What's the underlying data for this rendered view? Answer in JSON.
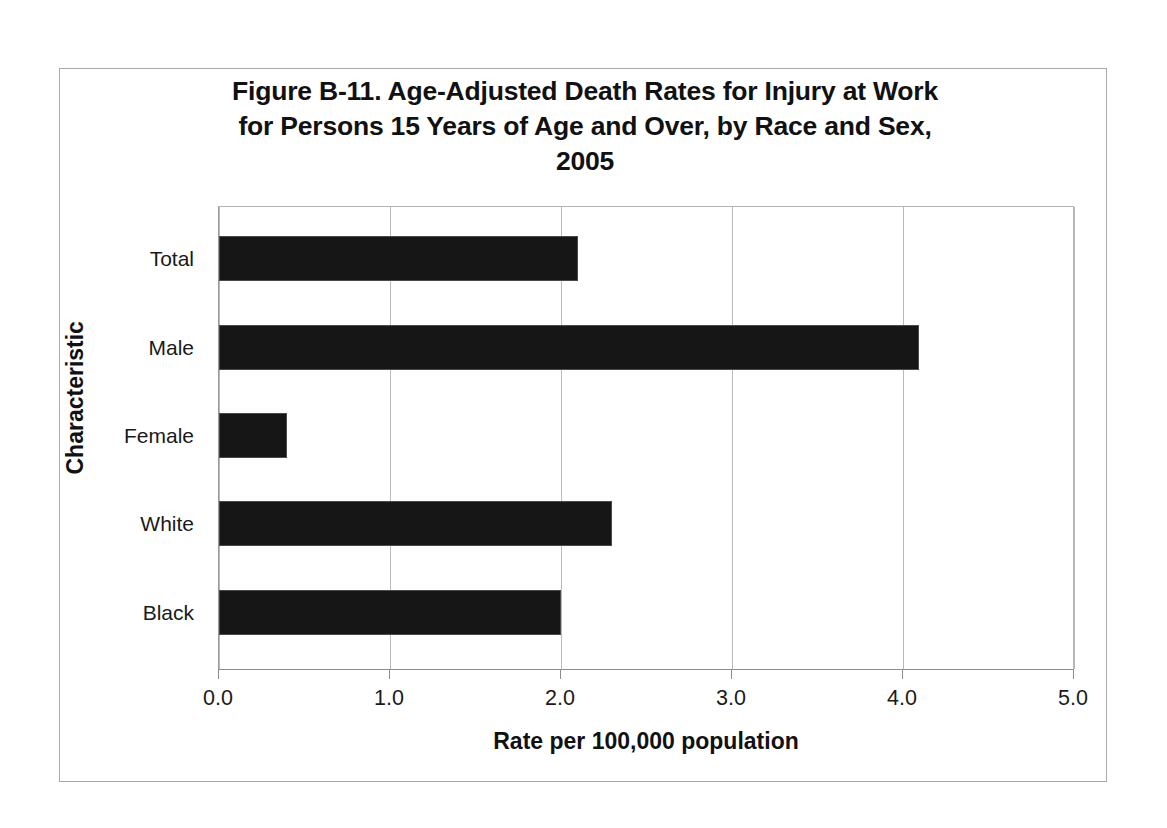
{
  "chart_data": {
    "type": "bar",
    "orientation": "horizontal",
    "title": "Figure B-11. Age-Adjusted Death Rates for Injury at Work for Persons 15 Years of Age and Over, by Race and Sex, 2005",
    "title_lines": [
      "Figure B-11. Age-Adjusted Death Rates for Injury at Work",
      "for Persons 15 Years of Age and Over, by Race and Sex,",
      "2005"
    ],
    "categories": [
      "Total",
      "Male",
      "Female",
      "White",
      "Black"
    ],
    "values": [
      2.1,
      4.1,
      0.4,
      2.3,
      2.0
    ],
    "xlabel": "Rate per 100,000 population",
    "ylabel": "Characteristic",
    "xlim": [
      0.0,
      5.0
    ],
    "xticks": [
      "0.0",
      "1.0",
      "2.0",
      "3.0",
      "4.0",
      "5.0"
    ],
    "xtick_values": [
      0.0,
      1.0,
      2.0,
      3.0,
      4.0,
      5.0
    ],
    "grid": "vertical",
    "legend": "none",
    "bar_color": "#161616",
    "gridline_color": "#b9b9b9",
    "axis_color": "#8c8c8c",
    "background_color": "#ffffff"
  }
}
